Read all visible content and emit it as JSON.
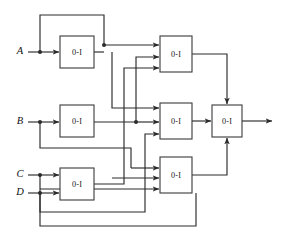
{
  "figure": {
    "type": "logic-circuit-diagram",
    "title": "",
    "background_color": "#ffffff",
    "line_color": "#2b2b2b",
    "box_fill": "#ffffff",
    "box_stroke": "#3a3a3a"
  },
  "inputs": [
    {
      "id": "A",
      "label": "A",
      "x": 20,
      "y": 52
    },
    {
      "id": "B",
      "label": "B",
      "x": 20,
      "y": 122
    },
    {
      "id": "C",
      "label": "C",
      "x": 20,
      "y": 175
    },
    {
      "id": "D",
      "label": "D",
      "x": 20,
      "y": 193
    }
  ],
  "gates": [
    {
      "id": "g1",
      "label": "0-I",
      "x": 60,
      "y": 36,
      "w": 34,
      "h": 32,
      "row": "top",
      "column": "left"
    },
    {
      "id": "g2",
      "label": "0-I",
      "x": 60,
      "y": 105,
      "w": 34,
      "h": 32,
      "row": "middle",
      "column": "left"
    },
    {
      "id": "g3",
      "label": "0-I",
      "x": 60,
      "y": 168,
      "w": 34,
      "h": 32,
      "row": "bottom",
      "column": "left"
    },
    {
      "id": "g4",
      "label": "0-I",
      "x": 160,
      "y": 36,
      "w": 32,
      "h": 36,
      "row": "top",
      "column": "right"
    },
    {
      "id": "g5",
      "label": "0-I",
      "x": 160,
      "y": 103,
      "w": 32,
      "h": 36,
      "row": "middle",
      "column": "right"
    },
    {
      "id": "g6",
      "label": "0-I",
      "x": 160,
      "y": 157,
      "w": 32,
      "h": 36,
      "row": "bottom",
      "column": "right"
    },
    {
      "id": "g7",
      "label": "0-I",
      "x": 212,
      "y": 105,
      "w": 30,
      "h": 32,
      "row": "middle",
      "column": "output"
    }
  ],
  "output": {
    "id": "out",
    "label": "",
    "x": 272,
    "y": 121
  },
  "gate_label_text": "0-I",
  "counts": {
    "gates": 7,
    "inputs": 4,
    "outputs": 1
  }
}
